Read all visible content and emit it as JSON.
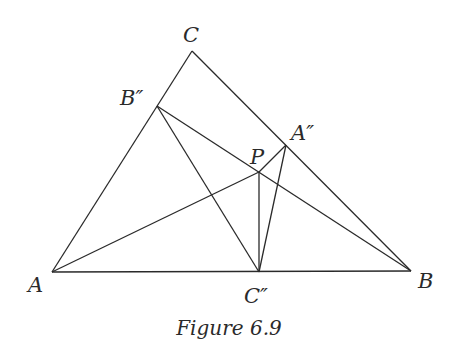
{
  "figure": {
    "caption": "Figure 6.9",
    "points": {
      "A": {
        "label": "A"
      },
      "B": {
        "label": "B"
      },
      "C": {
        "label": "C"
      },
      "P": {
        "label": "P"
      },
      "A2": {
        "label": "A″"
      },
      "B2": {
        "label": "B″"
      },
      "C2": {
        "label": "C″"
      }
    },
    "segments": [
      [
        "A",
        "B"
      ],
      [
        "B",
        "C"
      ],
      [
        "C",
        "A"
      ],
      [
        "B2",
        "B"
      ],
      [
        "B2",
        "C2"
      ],
      [
        "A",
        "P"
      ],
      [
        "P",
        "A2"
      ],
      [
        "P",
        "C2"
      ],
      [
        "A2",
        "C2"
      ]
    ]
  }
}
